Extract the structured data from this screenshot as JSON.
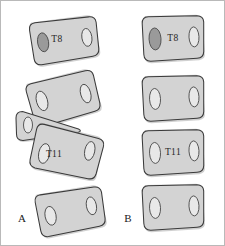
{
  "figure": {
    "background_color": "#ffffff",
    "frame_color": "#b9b9b9",
    "width": 225,
    "height": 246
  },
  "style_colors": {
    "vertebra_fill": "#d3d3d3",
    "vertebra_outline": "#3a3a3a",
    "vertebra_shadow": "#a9a9a9",
    "foramen_light_fill": "#e8e8e8",
    "foramen_dark_fill": "#9a9a9a",
    "label_color": "#262626"
  },
  "panels": [
    {
      "id": "panel-a",
      "label": "A",
      "label_x": 22,
      "label_y": 222,
      "description": "Wedged and rotated vertebral column segment",
      "vertebrae": [
        {
          "name": "vertebra-a-t8",
          "level_label": "T8",
          "label_x": 57,
          "label_y": 42,
          "rotation": -9,
          "cx": 64,
          "cy": 40,
          "width": 68,
          "height": 43,
          "left_foramen": "dark",
          "right_foramen": "light",
          "shape": "rectangular"
        },
        {
          "name": "vertebra-a-upper-mid",
          "level_label": "",
          "rotation": -16,
          "cx": 63,
          "cy": 98,
          "width": 70,
          "height": 45,
          "left_foramen": "light",
          "right_foramen": "light",
          "shape": "rectangular"
        },
        {
          "name": "vertebra-a-wedge",
          "level_label": "",
          "rotation": 0,
          "cx": 48,
          "cy": 127,
          "width": 62,
          "height": 30,
          "left_foramen": "light",
          "right_foramen": "none",
          "shape": "wedge-compressed"
        },
        {
          "name": "vertebra-a-t11",
          "level_label": "T11",
          "label_x": 54,
          "label_y": 156,
          "rotation": 12,
          "cx": 66,
          "cy": 152,
          "width": 70,
          "height": 45,
          "left_foramen": "light",
          "right_foramen": "light",
          "shape": "rectangular"
        },
        {
          "name": "vertebra-a-lower",
          "level_label": "",
          "rotation": -11,
          "cx": 70,
          "cy": 211,
          "width": 68,
          "height": 43,
          "left_foramen": "light",
          "right_foramen": "light",
          "shape": "rectangular"
        }
      ]
    },
    {
      "id": "panel-b",
      "label": "B",
      "label_x": 128,
      "label_y": 222,
      "description": "Normally aligned vertebral column segment",
      "vertebrae": [
        {
          "name": "vertebra-b-t8",
          "level_label": "T8",
          "label_x": 171,
          "label_y": 39,
          "rotation": -3,
          "cx": 173,
          "cy": 38,
          "width": 60,
          "height": 44,
          "left_foramen": "dark",
          "right_foramen": "light",
          "shape": "rectangular"
        },
        {
          "name": "vertebra-b-second",
          "level_label": "",
          "rotation": -3,
          "cx": 173,
          "cy": 98,
          "width": 60,
          "height": 44,
          "left_foramen": "light",
          "right_foramen": "light",
          "shape": "rectangular"
        },
        {
          "name": "vertebra-b-t11",
          "level_label": "T11",
          "label_x": 171,
          "label_y": 153,
          "rotation": -3,
          "cx": 173,
          "cy": 152,
          "width": 60,
          "height": 44,
          "left_foramen": "light",
          "right_foramen": "light",
          "shape": "rectangular"
        },
        {
          "name": "vertebra-b-fourth",
          "level_label": "",
          "rotation": -3,
          "cx": 173,
          "cy": 207,
          "width": 60,
          "height": 44,
          "left_foramen": "light",
          "right_foramen": "light",
          "shape": "rectangular"
        }
      ]
    }
  ]
}
